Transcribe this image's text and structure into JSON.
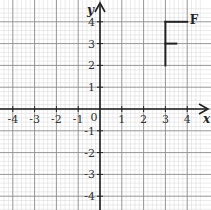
{
  "chart_data": {
    "type": "diagram",
    "title": "",
    "xlabel": "x",
    "ylabel": "y",
    "xlim": [
      -4,
      4
    ],
    "ylim": [
      -4,
      4
    ],
    "grid": true,
    "grid_minor_divisions": 5,
    "x_ticks": [
      {
        "value": -4,
        "label": "-4"
      },
      {
        "value": -3,
        "label": "-3"
      },
      {
        "value": -2,
        "label": "-2"
      },
      {
        "value": -1,
        "label": "-1"
      },
      {
        "value": 1,
        "label": "1"
      },
      {
        "value": 2,
        "label": "2"
      },
      {
        "value": 3,
        "label": "3"
      },
      {
        "value": 4,
        "label": "4"
      }
    ],
    "y_ticks": [
      {
        "value": 4,
        "label": "4"
      },
      {
        "value": 3,
        "label": "3"
      },
      {
        "value": 2,
        "label": "2"
      },
      {
        "value": 1,
        "label": "1"
      },
      {
        "value": -1,
        "label": "-1"
      },
      {
        "value": -2,
        "label": "-2"
      },
      {
        "value": -3,
        "label": "-3"
      },
      {
        "value": -4,
        "label": "-4"
      }
    ],
    "origin_label": "0",
    "shape": {
      "label": "F",
      "segments": [
        {
          "name": "stem",
          "from": [
            3,
            2
          ],
          "to": [
            3,
            4
          ]
        },
        {
          "name": "top-bar",
          "from": [
            3,
            4
          ],
          "to": [
            4,
            4
          ]
        },
        {
          "name": "middle-bar",
          "from": [
            3,
            3
          ],
          "to": [
            3.5,
            3
          ]
        }
      ],
      "label_position": [
        4.3,
        4.1
      ]
    },
    "colors": {
      "minor_grid": "#d6d6d6",
      "major_grid": "#8a8a8a",
      "axis": "#222222",
      "shape": "#222222"
    }
  }
}
